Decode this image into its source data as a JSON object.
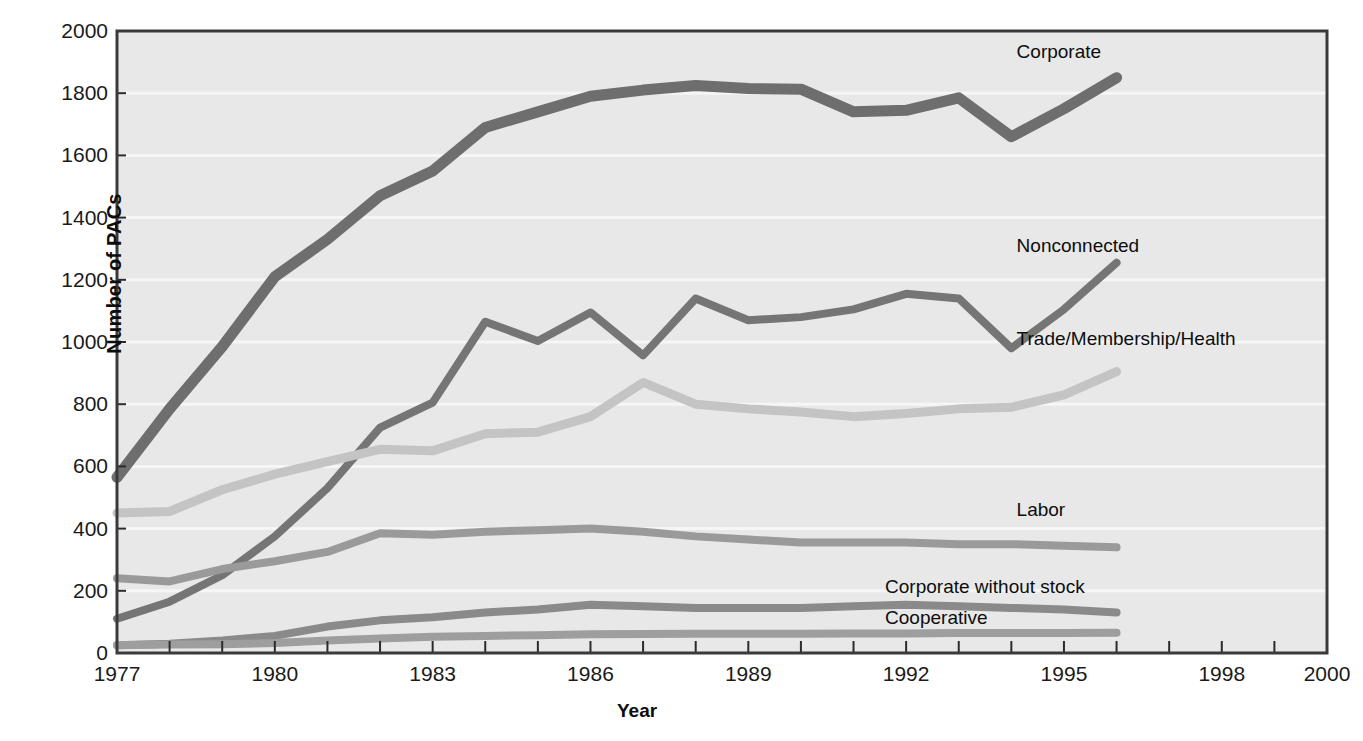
{
  "chart_data": {
    "type": "line",
    "title": "",
    "xlabel": "Year",
    "ylabel": "Number of PACs",
    "xlim": [
      1977,
      2000
    ],
    "ylim": [
      0,
      2000
    ],
    "yticks": [
      0,
      200,
      400,
      600,
      800,
      1000,
      1200,
      1400,
      1600,
      1800,
      2000
    ],
    "xticks": [
      1977,
      1978,
      1979,
      1980,
      1981,
      1982,
      1983,
      1984,
      1985,
      1986,
      1987,
      1988,
      1989,
      1990,
      1991,
      1992,
      1993,
      1994,
      1995,
      1996,
      1997,
      1998,
      1999,
      2000
    ],
    "xtick_labels": [
      {
        "value": 1977,
        "label": "1977"
      },
      {
        "value": 1980,
        "label": "1980"
      },
      {
        "value": 1983,
        "label": "1983"
      },
      {
        "value": 1986,
        "label": "1986"
      },
      {
        "value": 1989,
        "label": "1989"
      },
      {
        "value": 1992,
        "label": "1992"
      },
      {
        "value": 1995,
        "label": "1995"
      },
      {
        "value": 1998,
        "label": "1998"
      },
      {
        "value": 2000,
        "label": "2000"
      }
    ],
    "grid": true,
    "grid_orientation": "horizontal",
    "legend_position": "inline-right-of-line-ends",
    "x": [
      1977,
      1978,
      1979,
      1980,
      1981,
      1982,
      1983,
      1984,
      1985,
      1986,
      1987,
      1988,
      1989,
      1990,
      1991,
      1992,
      1993,
      1994,
      1995,
      1996
    ],
    "series": [
      {
        "name": "Corporate",
        "color": "#6e6e6e",
        "width": 11,
        "label_x": 1994.1,
        "label_y": 1930,
        "values": [
          565,
          785,
          985,
          1210,
          1330,
          1470,
          1550,
          1690,
          1740,
          1790,
          1810,
          1825,
          1815,
          1813,
          1740,
          1745,
          1785,
          1660,
          1750,
          1850
        ]
      },
      {
        "name": "Nonconnected",
        "color": "#757575",
        "width": 8,
        "label_x": 1994.1,
        "label_y": 1305,
        "values": [
          110,
          165,
          250,
          375,
          530,
          725,
          805,
          1065,
          1003,
          1095,
          957,
          1140,
          1070,
          1080,
          1105,
          1155,
          1140,
          980,
          1105,
          1255
        ]
      },
      {
        "name": "Trade/Membership/Health",
        "color": "#c4c4c4",
        "width": 9,
        "label_x": 1994.1,
        "label_y": 1008,
        "values": [
          450,
          455,
          525,
          575,
          615,
          655,
          650,
          705,
          710,
          760,
          870,
          800,
          785,
          775,
          760,
          770,
          785,
          790,
          830,
          905
        ]
      },
      {
        "name": "Labor",
        "color": "#9a9a9a",
        "width": 8,
        "label_x": 1994.1,
        "label_y": 455,
        "values": [
          240,
          230,
          270,
          295,
          325,
          385,
          380,
          390,
          395,
          400,
          390,
          375,
          365,
          355,
          355,
          355,
          350,
          350,
          345,
          340
        ]
      },
      {
        "name": "Corporate without stock",
        "color": "#8a8a8a",
        "width": 8,
        "label_x": 1991.6,
        "label_y": 208,
        "values": [
          25,
          30,
          40,
          55,
          85,
          105,
          115,
          130,
          140,
          155,
          150,
          145,
          145,
          145,
          150,
          155,
          150,
          145,
          140,
          130
        ]
      },
      {
        "name": "Cooperative",
        "color": "#9e9e9e",
        "width": 8,
        "label_x": 1991.6,
        "label_y": 110,
        "values": [
          25,
          27,
          28,
          32,
          40,
          47,
          52,
          55,
          57,
          60,
          61,
          62,
          62,
          62,
          63,
          63,
          64,
          64,
          64,
          65
        ]
      }
    ]
  },
  "axes": {
    "plot_bg": "#e8e8e8",
    "frame_color": "#3a3a3a",
    "grid_color": "#f6f6f6"
  }
}
